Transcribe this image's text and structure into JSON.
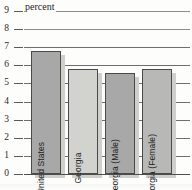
{
  "chart_data": {
    "type": "bar",
    "title": "",
    "subtitle": "",
    "annotation": "percent",
    "xlabel": "",
    "ylabel": "percent",
    "ylim": [
      0,
      9
    ],
    "ytick_interval": 1,
    "grid": true,
    "legend": false,
    "categories": [
      "United States",
      "Georgia",
      "Georgia (Male)",
      "Georgia (Female)"
    ],
    "values": [
      6.8,
      5.8,
      5.6,
      5.8
    ],
    "ytick_labels": [
      "0",
      "1",
      "2",
      "3",
      "4",
      "5",
      "6",
      "7",
      "8",
      "9"
    ],
    "bar_colors": [
      "#a8a8a8",
      "#d2d2cf",
      "#a8a8a8",
      "#b8b8b6"
    ],
    "bar_border_color": "#4a4a4a",
    "shadow_color": "#cfcfcb",
    "gridline_color": "#6e6e6e",
    "text_color": "#2b2b2b",
    "background": "#fdfdfc"
  },
  "axis": {
    "ticks": [
      {
        "label": "9",
        "value": 9
      },
      {
        "label": "8",
        "value": 8
      },
      {
        "label": "7",
        "value": 7
      },
      {
        "label": "6",
        "value": 6
      },
      {
        "label": "5",
        "value": 5
      },
      {
        "label": "4",
        "value": 4
      },
      {
        "label": "3",
        "value": 3
      },
      {
        "label": "2",
        "value": 2
      },
      {
        "label": "1",
        "value": 1
      },
      {
        "label": "0",
        "value": 0
      }
    ]
  },
  "bars": [
    {
      "label": "United States",
      "value": 6.8
    },
    {
      "label": "Georgia",
      "value": 5.8
    },
    {
      "label": "Georgia (Male)",
      "value": 5.6
    },
    {
      "label": "Georgia (Female)",
      "value": 5.8
    }
  ]
}
